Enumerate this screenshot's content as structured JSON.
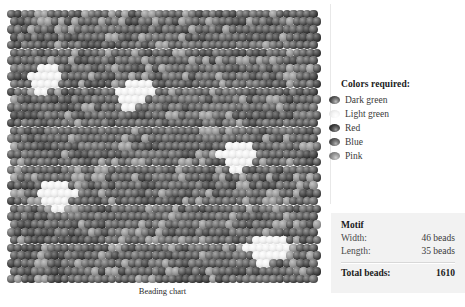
{
  "chart": {
    "caption": "Beading chart",
    "grid": {
      "columns": 46,
      "rows": 35,
      "offset_pattern": "brick"
    }
  },
  "legend": {
    "title": "Colors required:",
    "items": [
      {
        "label": "Dark green",
        "swatch": "bead-dark-green-icon",
        "tone": "#3b3b3b"
      },
      {
        "label": "Light green",
        "swatch": "bead-light-green-icon",
        "tone": "#e3e3e3"
      },
      {
        "label": "Red",
        "swatch": "bead-red-icon",
        "tone": "#2c2c2c"
      },
      {
        "label": "Blue",
        "swatch": "bead-blue-icon",
        "tone": "#4a4a4a"
      },
      {
        "label": "Pink",
        "swatch": "bead-pink-icon",
        "tone": "#7d7d7d"
      }
    ]
  },
  "motif": {
    "title": "Motif",
    "width_label": "Width:",
    "width_value": "46 beads",
    "length_label": "Length:",
    "length_value": "35 beads",
    "total_label": "Total beads:",
    "total_value": "1610"
  },
  "chart_data": {
    "type": "heatmap",
    "title": "Beading chart",
    "columns": 46,
    "rows": 35,
    "palette": [
      "Dark green",
      "Light green",
      "Red",
      "Blue",
      "Pink"
    ],
    "total_beads": 1610,
    "grid": [
      "00000000000000000000000000000000000000000000000",
      "0000000000000000000000000000000000000000000000",
      "0000000000000000000000000000000000000000000000",
      "0000000000000000000000000000000000000000000000",
      "0000000000000000000000000000000000000000000000",
      "0000000000000000000000000000000000000000000000",
      "0000000000000000000000000000000000000000000000",
      "0000111000000000000000000000000000000000000000",
      "0001111100000000000000000000000000000000000000",
      "0001111000000000011110000000000000000000000000",
      "0000110000000000111111000000000000000000000000",
      "0000000000000000111100000000000000000000000000",
      "0000000000000000011000000000000000000000000000",
      "0000000000000000000000000000000000000000000000",
      "0000000000000000000000000000000000000000000000",
      "0000000000000000000000000000000000000000000000",
      "0000000000000000000000000000000000000000000000",
      "0000000000000000000000000000000011110000000000",
      "0000000000000000000000000000000111111000000000",
      "0000000000000000000000000000000011110000000000",
      "0000000000000000000000000000000001100000000000",
      "0000000000000000000000000000000000000000000000",
      "0000011110000000000000000000000000000000000000",
      "0000111111000000000000000000000000000000000000",
      "0000011110000000000000000000000000000000000000",
      "0000001100000000000000000000000000000000000000",
      "0000000000000000000000000000000000000000000000",
      "0000000000000000000000000000000000000000000000",
      "0000000000000000000000000000000000000000000000",
      "0000000000000000000000000000000000001111100000",
      "0000000000000000000000000000000000011111110000",
      "0000000000000000000000000000000000001111100000",
      "0000000000000000000000000000000000000110000000",
      "0000000000000000000000000000000000000000000000",
      "0000000000000000000000000000000000000000000000"
    ]
  }
}
